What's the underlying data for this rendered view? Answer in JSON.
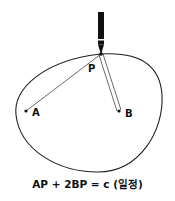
{
  "diagram": {
    "type": "ellipse-construction",
    "points": {
      "P": {
        "label": "P",
        "x": 101,
        "y": 54
      },
      "A": {
        "label": "A",
        "x": 26,
        "y": 111
      },
      "B": {
        "label": "B",
        "x": 119,
        "y": 111
      }
    },
    "segments": [
      {
        "from": "A",
        "to": "P",
        "style": "single-line"
      },
      {
        "from": "B",
        "to": "P",
        "style": "double-line"
      }
    ],
    "tool": "pen",
    "caption": "AP + 2BP = c (일정)",
    "colors": {
      "stroke": "#222222",
      "background": "#ffffff"
    }
  }
}
